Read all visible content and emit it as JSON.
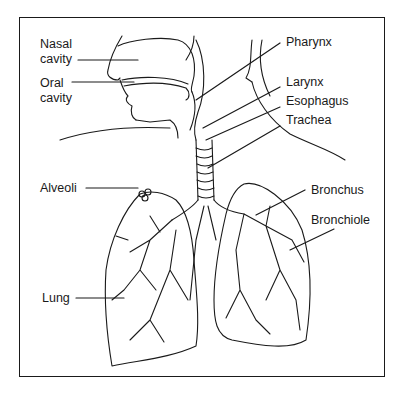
{
  "diagram": {
    "type": "anatomy",
    "labels": {
      "nasal_cavity_1": "Nasal",
      "nasal_cavity_2": "cavity",
      "oral_cavity_1": "Oral",
      "oral_cavity_2": "cavity",
      "pharynx": "Pharynx",
      "larynx": "Larynx",
      "esophagus": "Esophagus",
      "trachea": "Trachea",
      "alveoli": "Alveoli",
      "bronchus": "Bronchus",
      "bronchiole": "Bronchiole",
      "lung": "Lung"
    }
  }
}
